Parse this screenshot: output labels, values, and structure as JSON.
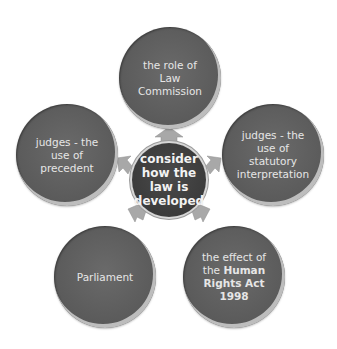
{
  "diagram": {
    "type": "radial-cycle",
    "center": {
      "label_lines": [
        "consider",
        "how the",
        "law is",
        "developed"
      ]
    },
    "nodes": [
      {
        "id": "top",
        "label_lines": [
          "the role of Law",
          "Commission"
        ]
      },
      {
        "id": "right",
        "label_lines": [
          "judges - the",
          "use of",
          "statutory",
          "interpretation"
        ]
      },
      {
        "id": "bottom-right",
        "line1": "the effect of",
        "line2_plain": "the ",
        "line2_bold": "Human",
        "line3_bold": "Rights Act",
        "line4_bold": "1998"
      },
      {
        "id": "bottom-left",
        "label_lines": [
          "Parliament"
        ]
      },
      {
        "id": "left",
        "label_lines": [
          "judges - the",
          "use of",
          "precedent"
        ]
      }
    ],
    "colors": {
      "node_fill": "#5a5a5a",
      "center_fill": "#3a3a3a",
      "arrow": "#a9a9a9",
      "text": "#e6e6e6"
    }
  }
}
